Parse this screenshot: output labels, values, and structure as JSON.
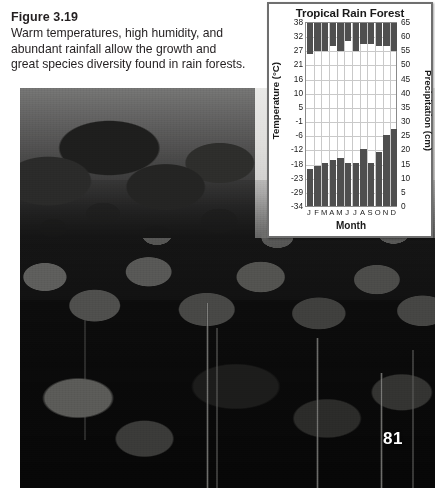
{
  "figure": {
    "number_label": "Figure 3.19",
    "caption_lines": [
      "Warm temperatures, high humidity, and",
      "abundant rainfall allow the growth and",
      "great species diversity found in rain forests."
    ]
  },
  "photo": {
    "alt_name": "tropical-rainforest-canopy-photograph"
  },
  "page_number": "81",
  "chart_data": {
    "type": "bar",
    "title": "Tropical Rain Forest",
    "xlabel": "Month",
    "categories": [
      "J",
      "F",
      "M",
      "A",
      "M",
      "J",
      "J",
      "A",
      "S",
      "O",
      "N",
      "D"
    ],
    "grid": true,
    "legend_position": "none",
    "series": [
      {
        "name": "Temperature (C)",
        "axis": "left",
        "unit": "C",
        "values": [
          26,
          27,
          27,
          29,
          27,
          31,
          27,
          30,
          30,
          29,
          29,
          27
        ]
      },
      {
        "name": "Precipitation (cm)",
        "axis": "right",
        "unit": "cm",
        "values": [
          13,
          14,
          15,
          16,
          17,
          15,
          15,
          20,
          15,
          19,
          25,
          27
        ]
      }
    ],
    "left_axis": {
      "label": "Temperature (°C)",
      "ylim": [
        -34,
        38
      ],
      "ticks": [
        38,
        32,
        27,
        21,
        16,
        10,
        5,
        -1,
        -6,
        -12,
        -18,
        -23,
        -29,
        -34
      ]
    },
    "right_axis": {
      "label": "Precipitation (cm)",
      "ylim": [
        0,
        65
      ],
      "ticks": [
        65,
        60,
        55,
        50,
        45,
        40,
        35,
        30,
        25,
        20,
        15,
        10,
        5,
        0
      ]
    }
  }
}
